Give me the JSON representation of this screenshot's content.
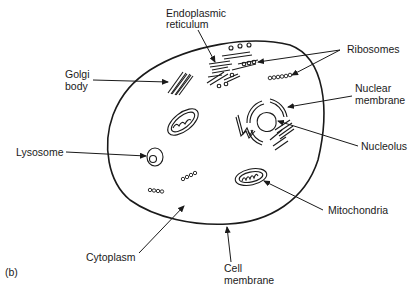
{
  "figure": {
    "panel_label": "(b)"
  },
  "labels": {
    "endoplasmic_reticulum": [
      "Endoplasmic",
      "reticulum"
    ],
    "ribosomes": "Ribosomes",
    "golgi_body": [
      "Golgi",
      "body"
    ],
    "nuclear_membrane": [
      "Nuclear",
      "membrane"
    ],
    "nucleolus": "Nucleolus",
    "lysosome": "Lysosome",
    "mitochondria": "Mitochondria",
    "cytoplasm": "Cytoplasm",
    "cell_membrane": [
      "Cell",
      "membrane"
    ]
  },
  "colors": {
    "ink": "#1a1a1a",
    "background": "#ffffff"
  }
}
